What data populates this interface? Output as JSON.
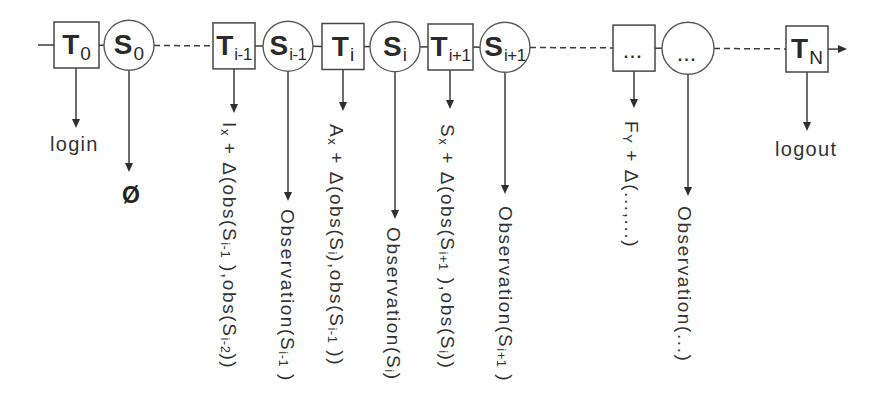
{
  "diagram": {
    "nodes": [
      {
        "kind": "transition",
        "main": "T",
        "sub": "0"
      },
      {
        "kind": "state",
        "main": "S",
        "sub": "0"
      },
      {
        "kind": "transition",
        "main": "T",
        "sub": "i-1"
      },
      {
        "kind": "state",
        "main": "S",
        "sub": "i-1"
      },
      {
        "kind": "transition",
        "main": "T",
        "sub": "i"
      },
      {
        "kind": "state",
        "main": "S",
        "sub": "i"
      },
      {
        "kind": "transition",
        "main": "T",
        "sub": "i+1"
      },
      {
        "kind": "state",
        "main": "S",
        "sub": "i+1"
      },
      {
        "kind": "transition",
        "main": "...",
        "sub": ""
      },
      {
        "kind": "state",
        "main": "...",
        "sub": ""
      },
      {
        "kind": "transition",
        "main": "T",
        "sub": "N"
      }
    ],
    "outputs": [
      {
        "text": "login"
      },
      {
        "text": "Ø"
      },
      {
        "segments": [
          {
            "text": "I"
          },
          {
            "sub": "x"
          },
          {
            "text": " + Δ(obs(S"
          },
          {
            "sub": "i-1"
          },
          {
            "text": " ),obs(S"
          },
          {
            "sub": "i-2"
          },
          {
            "text": "))"
          }
        ]
      },
      {
        "segments": [
          {
            "text": "Observation(S"
          },
          {
            "sub": "i-1"
          },
          {
            "text": " )"
          }
        ]
      },
      {
        "segments": [
          {
            "text": "A"
          },
          {
            "sub": "x"
          },
          {
            "text": " + Δ(obs(S"
          },
          {
            "sub": "i"
          },
          {
            "text": "),obs(S"
          },
          {
            "sub": "i-1"
          },
          {
            "text": " ))"
          }
        ]
      },
      {
        "segments": [
          {
            "text": "Observation(S"
          },
          {
            "sub": "i"
          },
          {
            "text": ")"
          }
        ]
      },
      {
        "segments": [
          {
            "text": "S"
          },
          {
            "sub": "x"
          },
          {
            "text": " + Δ(obs(S"
          },
          {
            "sub": "i+1"
          },
          {
            "text": " ),obs(S"
          },
          {
            "sub": "i"
          },
          {
            "text": "))"
          }
        ]
      },
      {
        "segments": [
          {
            "text": "Observation(S"
          },
          {
            "sub": "i+1"
          },
          {
            "text": " )"
          }
        ]
      },
      {
        "segments": [
          {
            "text": "F"
          },
          {
            "sub": "Y"
          },
          {
            "text": " + Δ(...,...)"
          }
        ]
      },
      {
        "segments": [
          {
            "text": "Observation(...)"
          }
        ]
      },
      {
        "text": "logout"
      }
    ]
  },
  "colors": {
    "line": "#3c3c3c",
    "box_stroke": "#474747",
    "circle_stroke": "#5a5a5a",
    "text": "#2e2e2e",
    "background": "#ffffff"
  }
}
